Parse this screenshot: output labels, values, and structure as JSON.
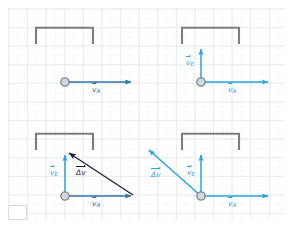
{
  "figure": {
    "domain": "physics-vector-diagram",
    "background": "graph-paper",
    "grid_color": "#e3e6ea",
    "page_color": "#ffffff",
    "width": 292,
    "height": 227,
    "panel_count": 4
  },
  "colors": {
    "grid": "#e3e6ea",
    "frame_gray": "#7b7d80",
    "vector_blue": "#2f6fa8",
    "vector_cyan": "#29a3dd",
    "vector_dark": "#1b1f3b",
    "marker_fill": "#cfd8de",
    "marker_stroke": "#7f8a92"
  },
  "labels": {
    "vA": "v",
    "vA_sub": "A",
    "vE": "v",
    "vE_sub": "E",
    "dv": "Δv"
  },
  "panels": [
    {
      "id": "panel-1",
      "name": "panel-top-left",
      "description": "ball with horizontal velocity vA only, goal frame above",
      "frame": {
        "x": 36,
        "y": 27,
        "w": 57,
        "h": 17,
        "open": "bottom"
      },
      "marker": {
        "x": 65,
        "y": 82,
        "r": 4
      },
      "vectors": [
        {
          "name": "vA",
          "color": "#2f6fa8",
          "from": [
            65,
            82
          ],
          "to": [
            134,
            82
          ],
          "label": "v",
          "sub": "A",
          "label_pos": [
            96,
            88
          ]
        }
      ]
    },
    {
      "id": "panel-2",
      "name": "panel-top-right",
      "description": "ball with vA horizontal and vE vertical up toward goal",
      "frame": {
        "x": 182,
        "y": 27,
        "w": 57,
        "h": 17,
        "open": "bottom"
      },
      "marker": {
        "x": 201,
        "y": 82,
        "r": 4
      },
      "vectors": [
        {
          "name": "vA",
          "color": "#29a3dd",
          "from": [
            201,
            82
          ],
          "to": [
            271,
            82
          ],
          "label": "v",
          "sub": "A",
          "label_pos": [
            232,
            88
          ]
        },
        {
          "name": "vE",
          "color": "#29a3dd",
          "from": [
            201,
            82
          ],
          "to": [
            201,
            46
          ],
          "label": "v",
          "sub": "E",
          "label_pos": [
            188,
            62
          ]
        }
      ]
    },
    {
      "id": "panel-3",
      "name": "panel-bottom-left",
      "description": "vector triangle: vA plus vE giving delta-v pointing up-left",
      "frame": {
        "x": 36,
        "y": 133,
        "w": 57,
        "h": 17,
        "open": "bottom"
      },
      "marker": {
        "x": 65,
        "y": 196,
        "r": 4
      },
      "vectors": [
        {
          "name": "vA",
          "color": "#2f6fa8",
          "from": [
            65,
            196
          ],
          "to": [
            134,
            196
          ],
          "label": "v",
          "sub": "A",
          "label_pos": [
            96,
            203
          ]
        },
        {
          "name": "vE",
          "color": "#29a3dd",
          "from": [
            65,
            196
          ],
          "to": [
            65,
            152
          ],
          "label": "v",
          "sub": "E",
          "label_pos": [
            52,
            172
          ]
        },
        {
          "name": "dv",
          "color": "#1b1f3b",
          "from": [
            134,
            196
          ],
          "to": [
            67,
            152
          ],
          "label": "Δv",
          "label_pos": [
            82,
            172
          ]
        }
      ]
    },
    {
      "id": "panel-4",
      "name": "panel-bottom-right",
      "description": "vA, vE and resultant delta-v pointing up-left past the frame",
      "frame": {
        "x": 182,
        "y": 133,
        "w": 57,
        "h": 17,
        "open": "bottom"
      },
      "marker": {
        "x": 201,
        "y": 196,
        "r": 4
      },
      "vectors": [
        {
          "name": "vA",
          "color": "#29a3dd",
          "from": [
            201,
            196
          ],
          "to": [
            271,
            196
          ],
          "label": "v",
          "sub": "A",
          "label_pos": [
            232,
            203
          ]
        },
        {
          "name": "vE",
          "color": "#29a3dd",
          "from": [
            201,
            196
          ],
          "to": [
            201,
            152
          ],
          "label": "v",
          "sub": "E",
          "label_pos": [
            189,
            172
          ]
        },
        {
          "name": "dv",
          "color": "#29a3dd",
          "from": [
            201,
            196
          ],
          "to": [
            146,
            148
          ],
          "label": "Δv",
          "label_pos": [
            156,
            176
          ]
        }
      ]
    }
  ],
  "corner_mark": {
    "name": "page-corner-mark",
    "visible": true
  }
}
